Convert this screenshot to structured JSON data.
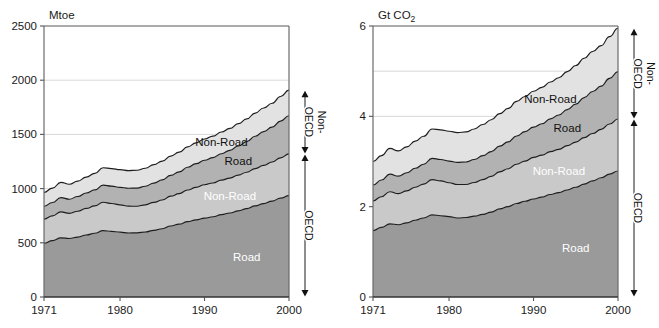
{
  "figure": {
    "title": "",
    "panels": [
      {
        "name": "energy-panel",
        "unit_label": "Mtoe",
        "xlabel": "",
        "ylabel": "Mtoe",
        "xticks": [
          "1971",
          "1980",
          "1990",
          "2000"
        ],
        "yticks": [
          "0",
          "500",
          "1000",
          "1500",
          "2000",
          "2500"
        ],
        "series_labels": {
          "non_oecd_non_road": "Non-Road",
          "non_oecd_road": "Road",
          "oecd_non_road": "Non-Road",
          "oecd_road": "Road"
        },
        "brackets": {
          "upper_main": "OECD",
          "upper_prefix": "Non-",
          "lower_main": "OECD"
        }
      },
      {
        "name": "emissions-panel",
        "unit_label_prefix": "Gt CO",
        "unit_label_sub": "2",
        "xlabel": "",
        "ylabel": "Gt CO2",
        "xticks": [
          "1971",
          "1980",
          "1990",
          "2000"
        ],
        "yticks": [
          "0",
          "2",
          "4",
          "6"
        ],
        "series_labels": {
          "non_oecd_non_road": "Non-Road",
          "non_oecd_road": "Road",
          "oecd_non_road": "Non-Road",
          "oecd_road": "Road"
        },
        "brackets": {
          "upper_main": "OECD",
          "upper_prefix": "Non-",
          "lower_main": "OECD"
        }
      }
    ]
  },
  "colors": {
    "oecd_road": "#9a9a9a",
    "oecd_non_road": "#c9c9c9",
    "non_oecd_road": "#b2b2b2",
    "non_oecd_non_road": "#e2e2e2",
    "outline": "#1d1d1d",
    "grid": "#d8d8d8",
    "axis": "#6b6b6b",
    "text": "#1a1a1a"
  },
  "chart_data": [
    {
      "type": "area",
      "title": "Mtoe",
      "xlabel": "",
      "ylabel": "Mtoe",
      "xlim": [
        1971,
        2000
      ],
      "ylim": [
        0,
        2500
      ],
      "yticks": [
        0,
        500,
        1000,
        1500,
        2000,
        2500
      ],
      "xticks": [
        1971,
        1980,
        1990,
        2000
      ],
      "grid": true,
      "legend": "inline-annotations",
      "stacked": true,
      "x": [
        1971,
        1972,
        1973,
        1974,
        1975,
        1976,
        1977,
        1978,
        1979,
        1980,
        1981,
        1982,
        1983,
        1984,
        1985,
        1986,
        1987,
        1988,
        1989,
        1990,
        1991,
        1992,
        1993,
        1994,
        1995,
        1996,
        1997,
        1998,
        1999,
        2000
      ],
      "series": [
        {
          "name": "OECD Road",
          "color": "#9a9a9a",
          "values": [
            497,
            520,
            545,
            540,
            553,
            572,
            588,
            612,
            605,
            598,
            590,
            592,
            600,
            615,
            630,
            655,
            672,
            695,
            712,
            728,
            740,
            760,
            775,
            795,
            815,
            840,
            862,
            885,
            912,
            935
          ]
        },
        {
          "name": "OECD Non-Road",
          "color": "#c9c9c9",
          "values": [
            222,
            228,
            240,
            232,
            238,
            245,
            252,
            262,
            258,
            252,
            248,
            245,
            250,
            258,
            265,
            275,
            282,
            292,
            300,
            308,
            312,
            318,
            322,
            330,
            336,
            345,
            352,
            360,
            372,
            385
          ]
        },
        {
          "name": "Non-OECD Road",
          "color": "#b2b2b2",
          "values": [
            118,
            124,
            132,
            130,
            136,
            142,
            148,
            158,
            160,
            162,
            165,
            168,
            172,
            178,
            185,
            192,
            200,
            210,
            218,
            226,
            234,
            244,
            256,
            268,
            282,
            298,
            312,
            322,
            338,
            352
          ]
        },
        {
          "name": "Non-OECD Non-Road",
          "color": "#e2e2e2",
          "values": [
            128,
            133,
            140,
            138,
            142,
            147,
            152,
            160,
            162,
            163,
            163,
            164,
            166,
            170,
            174,
            178,
            182,
            188,
            192,
            196,
            198,
            200,
            202,
            206,
            210,
            214,
            218,
            220,
            228,
            236
          ]
        }
      ]
    },
    {
      "type": "area",
      "title": "Gt CO2",
      "xlabel": "",
      "ylabel": "Gt CO2",
      "xlim": [
        1971,
        2000
      ],
      "ylim": [
        0,
        6
      ],
      "yticks": [
        0,
        1,
        2,
        3,
        4,
        5,
        6
      ],
      "ytick_labels": [
        "0",
        "",
        "2",
        "",
        "4",
        "",
        "6"
      ],
      "xticks": [
        1971,
        1980,
        1990,
        2000
      ],
      "grid": true,
      "legend": "inline-annotations",
      "stacked": true,
      "x": [
        1971,
        1972,
        1973,
        1974,
        1975,
        1976,
        1977,
        1978,
        1979,
        1980,
        1981,
        1982,
        1983,
        1984,
        1985,
        1986,
        1987,
        1988,
        1989,
        1990,
        1991,
        1992,
        1993,
        1994,
        1995,
        1996,
        1997,
        1998,
        1999,
        2000
      ],
      "series": [
        {
          "name": "OECD Road",
          "color": "#9a9a9a",
          "values": [
            1.47,
            1.54,
            1.62,
            1.6,
            1.64,
            1.7,
            1.75,
            1.82,
            1.8,
            1.78,
            1.75,
            1.76,
            1.79,
            1.83,
            1.88,
            1.95,
            2.0,
            2.07,
            2.12,
            2.17,
            2.21,
            2.27,
            2.31,
            2.37,
            2.43,
            2.5,
            2.57,
            2.64,
            2.72,
            2.79
          ]
        },
        {
          "name": "OECD Non-Road",
          "color": "#c9c9c9",
          "values": [
            0.66,
            0.68,
            0.71,
            0.69,
            0.71,
            0.73,
            0.75,
            0.78,
            0.77,
            0.75,
            0.74,
            0.73,
            0.745,
            0.77,
            0.79,
            0.82,
            0.84,
            0.87,
            0.89,
            0.92,
            0.93,
            0.95,
            0.96,
            0.98,
            1.0,
            1.03,
            1.05,
            1.07,
            1.11,
            1.15
          ]
        },
        {
          "name": "Non-OECD Road",
          "color": "#b2b2b2",
          "values": [
            0.35,
            0.37,
            0.39,
            0.385,
            0.4,
            0.42,
            0.44,
            0.47,
            0.475,
            0.48,
            0.49,
            0.5,
            0.51,
            0.53,
            0.55,
            0.57,
            0.595,
            0.625,
            0.65,
            0.67,
            0.695,
            0.725,
            0.76,
            0.8,
            0.84,
            0.885,
            0.93,
            0.96,
            1.01,
            1.05
          ]
        },
        {
          "name": "Non-OECD Non-Road",
          "color": "#e2e2e2",
          "values": [
            0.52,
            0.54,
            0.57,
            0.56,
            0.575,
            0.6,
            0.62,
            0.65,
            0.655,
            0.66,
            0.66,
            0.665,
            0.675,
            0.69,
            0.705,
            0.72,
            0.74,
            0.765,
            0.78,
            0.795,
            0.805,
            0.815,
            0.825,
            0.84,
            0.855,
            0.87,
            0.885,
            0.895,
            0.925,
            0.96
          ]
        }
      ]
    }
  ]
}
